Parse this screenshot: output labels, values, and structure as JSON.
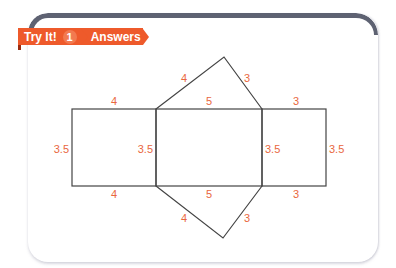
{
  "header": {
    "badge_label": "Try It!",
    "badge_number": "1",
    "answers_label": "Answers",
    "accent_color": "#ee5a2b",
    "bar_color": "#5e6272"
  },
  "diagram": {
    "line_color": "#444444",
    "label_color": "#e9673e",
    "labels": {
      "left_rect_top": "4",
      "left_rect_bottom": "4",
      "left_rect_left": "3.5",
      "middle_rect_left": "3.5",
      "middle_rect_top": "5",
      "middle_rect_bottom": "5",
      "middle_rect_right": "3.5",
      "right_rect_top": "3",
      "right_rect_bottom": "3",
      "right_rect_right": "3.5",
      "top_triangle_left": "4",
      "top_triangle_right": "3",
      "bottom_triangle_left": "4",
      "bottom_triangle_right": "3"
    }
  }
}
